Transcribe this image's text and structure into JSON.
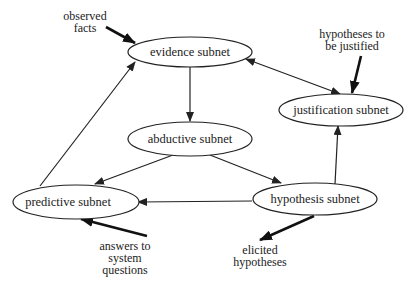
{
  "diagram": {
    "nodes": {
      "evidence": {
        "label": "evidence subnet"
      },
      "abductive": {
        "label": "abductive subnet"
      },
      "justification": {
        "label": "justification subnet"
      },
      "predictive": {
        "label": "predictive subnet"
      },
      "hypothesis": {
        "label": "hypothesis subnet"
      }
    },
    "external": {
      "observed_facts": {
        "line1": "observed",
        "line2": "facts"
      },
      "hypotheses_to_justify": {
        "line1": "hypotheses to",
        "line2": "be justified"
      },
      "answers": {
        "line1": "answers to",
        "line2": "system",
        "line3": "questions"
      },
      "elicited": {
        "line1": "elicited",
        "line2": "hypotheses"
      }
    },
    "edges": [
      {
        "from": "evidence",
        "to": "abductive"
      },
      {
        "from": "abductive",
        "to": "predictive"
      },
      {
        "from": "abductive",
        "to": "hypothesis"
      },
      {
        "from": "hypothesis",
        "to": "predictive"
      },
      {
        "from": "hypothesis",
        "to": "justification"
      },
      {
        "from": "predictive",
        "to": "evidence"
      },
      {
        "from": "evidence",
        "to": "justification",
        "bidirectional": true
      },
      {
        "from": "observed_facts",
        "to": "evidence",
        "bold": true
      },
      {
        "from": "hypotheses_to_justify",
        "to": "justification",
        "bold": true
      },
      {
        "from": "answers",
        "to": "predictive",
        "bold": true
      },
      {
        "from": "hypothesis",
        "to": "elicited",
        "bold": true
      }
    ],
    "colors": {
      "stroke": "#222222",
      "background": "#ffffff"
    }
  }
}
